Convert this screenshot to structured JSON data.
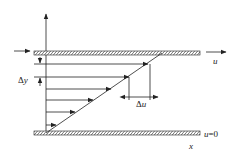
{
  "diagram": {
    "labels": {
      "top_plate_velocity": "u",
      "bottom_plate_velocity": "u=0",
      "x_axis": "x",
      "delta_y": "Δy",
      "delta_u": "Δu"
    },
    "colors": {
      "line": "#222222",
      "background": "#ffffff"
    },
    "velocity_vectors": [
      {
        "y": 64,
        "tip_x": 148
      },
      {
        "y": 77,
        "tip_x": 129
      },
      {
        "y": 89,
        "tip_x": 111
      },
      {
        "y": 100,
        "tip_x": 93
      },
      {
        "y": 112,
        "tip_x": 75
      },
      {
        "y": 125,
        "tip_x": 56
      }
    ]
  }
}
